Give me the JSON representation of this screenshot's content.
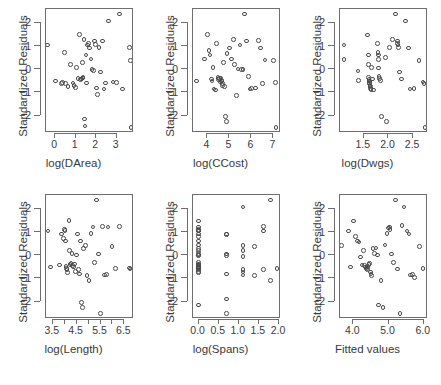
{
  "figure": {
    "title": "",
    "rows": 2,
    "cols": 3,
    "background": "#ffffff",
    "point_color": "#4a4a4a",
    "axis_color": "#6e6e6e"
  },
  "chart_data": [
    {
      "type": "scatter",
      "title": "",
      "xlabel": "log(DArea)",
      "ylabel": "Standardized Residuals",
      "xlim": [
        -0.45,
        3.85
      ],
      "ylim": [
        -2.75,
        2.6
      ],
      "xticks": [
        0,
        1,
        2,
        3
      ],
      "xticklabels": [
        "0",
        "1",
        "2",
        "3"
      ],
      "yticks": [
        2,
        1,
        0,
        -1,
        -2
      ],
      "yticklabels": [
        "2",
        "1",
        "0",
        "-1",
        "-2"
      ],
      "grid": false,
      "legend": "none",
      "marker": "open-circle",
      "x": [
        -0.38,
        0.02,
        0.3,
        0.35,
        0.44,
        0.5,
        0.62,
        0.74,
        0.86,
        0.92,
        0.98,
        1.05,
        1.12,
        1.18,
        1.24,
        1.28,
        1.32,
        1.34,
        1.36,
        1.4,
        1.42,
        1.45,
        1.5,
        1.52,
        1.58,
        1.62,
        1.68,
        1.74,
        1.8,
        1.86,
        1.92,
        1.96,
        2.02,
        2.08,
        2.14,
        2.22,
        2.3,
        2.38,
        2.46,
        2.6,
        2.82,
        3.0,
        3.14,
        3.3,
        3.62,
        3.68,
        3.7
      ],
      "y": [
        1.05,
        -0.5,
        -0.62,
        -0.58,
        0.72,
        -0.62,
        -0.74,
        0.2,
        -0.6,
        -0.7,
        -0.78,
        0.08,
        -0.4,
        1.5,
        -0.45,
        -0.42,
        0.28,
        -0.38,
        -0.35,
        1.28,
        -2.15,
        -2.45,
        0.62,
        -0.6,
        1.05,
        1.12,
        0.92,
        0.45,
        0.0,
        -0.05,
        1.22,
        1.08,
        -0.8,
        -1.1,
        0.95,
        -0.12,
        1.22,
        -0.85,
        -0.6,
        2.08,
        -0.55,
        -0.58,
        2.38,
        -0.85,
        0.95,
        0.38,
        -2.5
      ]
    },
    {
      "type": "scatter",
      "title": "",
      "xlabel": "log(CCost)",
      "ylabel": "Standardized Residuals",
      "xlim": [
        3.35,
        7.35
      ],
      "ylim": [
        -2.75,
        2.6
      ],
      "xticks": [
        4,
        5,
        6,
        7
      ],
      "xticklabels": [
        "4",
        "5",
        "6",
        "7"
      ],
      "yticks": [
        2,
        1,
        0,
        -1,
        -2
      ],
      "yticklabels": [
        "2",
        "1",
        "0",
        "-1",
        "-2"
      ],
      "grid": false,
      "legend": "none",
      "marker": "open-circle",
      "x": [
        3.5,
        3.88,
        4.02,
        4.08,
        4.12,
        4.18,
        4.22,
        4.26,
        4.3,
        4.36,
        4.42,
        4.48,
        4.52,
        4.56,
        4.6,
        4.62,
        4.64,
        4.66,
        4.68,
        4.7,
        4.74,
        4.78,
        4.82,
        4.86,
        4.9,
        5.02,
        5.1,
        5.18,
        5.24,
        5.32,
        5.4,
        5.48,
        5.56,
        5.62,
        5.7,
        5.78,
        5.86,
        5.94,
        6.02,
        6.18,
        6.32,
        6.42,
        6.5,
        6.62,
        7.02,
        7.1,
        7.12
      ],
      "y": [
        -0.5,
        0.45,
        1.5,
        0.82,
        0.62,
        -0.42,
        -0.5,
        0.08,
        -0.85,
        -0.9,
        1.12,
        -0.35,
        -0.45,
        -0.4,
        -0.55,
        -0.38,
        -0.48,
        -0.5,
        -0.62,
        -0.7,
        0.28,
        -0.75,
        -2.05,
        -2.25,
        0.68,
        0.92,
        0.45,
        1.28,
        0.2,
        -1.12,
        0.02,
        1.05,
        0.0,
        0.0,
        2.38,
        1.22,
        -0.32,
        -0.85,
        -0.82,
        -0.8,
        1.25,
        0.92,
        -0.62,
        0.4,
        0.38,
        -0.58,
        -2.5
      ]
    },
    {
      "type": "scatter",
      "title": "",
      "xlabel": "log(Dwgs)",
      "ylabel": "Standardized Residuals",
      "xlim": [
        1.02,
        2.8
      ],
      "ylim": [
        -2.75,
        2.6
      ],
      "xticks": [
        1.5,
        2.0,
        2.5
      ],
      "xticklabels": [
        "1.5",
        "2.0",
        "2.5"
      ],
      "yticks": [
        2,
        1,
        0,
        -1,
        -2
      ],
      "yticklabels": [
        "2",
        "1",
        "0",
        "-1",
        "-2"
      ],
      "grid": false,
      "legend": "none",
      "marker": "open-circle",
      "x": [
        1.1,
        1.1,
        1.38,
        1.4,
        1.58,
        1.6,
        1.6,
        1.6,
        1.61,
        1.62,
        1.62,
        1.62,
        1.63,
        1.64,
        1.64,
        1.65,
        1.66,
        1.68,
        1.7,
        1.78,
        1.79,
        1.8,
        1.8,
        1.8,
        1.81,
        1.82,
        1.84,
        1.86,
        1.94,
        1.96,
        2.02,
        2.08,
        2.14,
        2.18,
        2.18,
        2.19,
        2.2,
        2.22,
        2.26,
        2.34,
        2.4,
        2.44,
        2.52,
        2.62,
        2.7,
        2.72,
        2.74
      ],
      "y": [
        1.05,
        0.42,
        -0.08,
        -0.48,
        1.48,
        0.62,
        0.2,
        -0.35,
        -0.45,
        -0.5,
        -0.58,
        -0.62,
        -0.7,
        -0.75,
        -0.82,
        -0.88,
        0.08,
        -0.42,
        -0.9,
        1.12,
        0.72,
        0.62,
        0.42,
        0.05,
        -0.32,
        -0.4,
        -0.48,
        -2.05,
        0.52,
        -2.25,
        0.95,
        1.28,
        2.38,
        1.22,
        1.12,
        1.05,
        0.95,
        -0.12,
        -0.42,
        2.08,
        0.92,
        -0.85,
        -0.82,
        0.38,
        -0.55,
        -0.62,
        -2.5
      ]
    },
    {
      "type": "scatter",
      "title": "",
      "xlabel": "log(Length)",
      "ylabel": "Standardized Residuals",
      "xlim": [
        3.22,
        6.9
      ],
      "ylim": [
        -2.75,
        2.6
      ],
      "xticks": [
        3.5,
        4.0,
        4.5,
        5.0,
        5.5,
        6.0,
        6.5
      ],
      "xticklabels": [
        "3.5",
        "",
        "4.5",
        "",
        "5.5",
        "",
        "6.5"
      ],
      "yticks": [
        2,
        1,
        0,
        -1,
        -2
      ],
      "yticklabels": [
        "2",
        "1",
        "0",
        "-1",
        "-2"
      ],
      "grid": false,
      "legend": "none",
      "marker": "open-circle",
      "x": [
        3.3,
        3.4,
        3.78,
        3.88,
        3.96,
        4.0,
        4.02,
        4.04,
        4.06,
        4.08,
        4.1,
        4.12,
        4.18,
        4.2,
        4.22,
        4.26,
        4.3,
        4.34,
        4.38,
        4.42,
        4.46,
        4.5,
        4.54,
        4.58,
        4.62,
        4.66,
        4.7,
        4.74,
        4.8,
        4.86,
        4.94,
        5.02,
        5.1,
        5.18,
        5.26,
        5.34,
        5.42,
        5.5,
        5.58,
        5.66,
        5.74,
        5.82,
        5.98,
        6.12,
        6.3,
        6.72,
        6.74
      ],
      "y": [
        1.05,
        -0.5,
        -0.42,
        0.92,
        0.72,
        1.12,
        1.08,
        0.62,
        -0.48,
        -0.58,
        -0.62,
        -0.75,
        1.5,
        0.2,
        -0.4,
        -0.35,
        0.08,
        -0.45,
        -0.5,
        -0.38,
        -0.7,
        0.02,
        0.92,
        -0.62,
        -0.8,
        0.62,
        -2.05,
        -2.25,
        0.28,
        0.42,
        -0.88,
        -1.1,
        0.95,
        1.22,
        -0.32,
        2.38,
        0.05,
        -2.5,
        1.25,
        -0.85,
        -0.82,
        1.22,
        0.38,
        -0.58,
        1.25,
        -0.55,
        -0.6
      ]
    },
    {
      "type": "scatter",
      "title": "",
      "xlabel": "log(Spans)",
      "ylabel": "Standardized Residuals",
      "xlim": [
        -0.14,
        2.05
      ],
      "ylim": [
        -2.75,
        2.6
      ],
      "xticks": [
        0.0,
        0.5,
        1.0,
        1.5,
        2.0
      ],
      "xticklabels": [
        "0.0",
        "0.5",
        "1.0",
        "1.5",
        "2.0"
      ],
      "yticks": [
        2,
        1,
        0,
        -1,
        -2
      ],
      "yticklabels": [
        "2",
        "1",
        "0",
        "-1",
        "-2"
      ],
      "grid": false,
      "legend": "none",
      "marker": "open-circle",
      "x": [
        0.0,
        0.0,
        0.0,
        0.0,
        0.0,
        0.0,
        0.0,
        0.0,
        0.0,
        0.0,
        0.0,
        0.0,
        0.0,
        0.0,
        0.0,
        0.0,
        0.0,
        0.0,
        0.0,
        0.0,
        0.0,
        0.0,
        0.0,
        0.0,
        0.0,
        0.69,
        0.69,
        0.69,
        0.69,
        0.69,
        0.69,
        0.69,
        1.1,
        1.1,
        1.1,
        1.1,
        1.1,
        1.1,
        1.1,
        1.39,
        1.39,
        1.61,
        1.61,
        1.61,
        1.79,
        1.79,
        1.95
      ],
      "y": [
        1.48,
        1.22,
        1.1,
        1.08,
        1.05,
        0.92,
        0.82,
        0.62,
        0.45,
        0.28,
        0.2,
        0.08,
        0.02,
        0.0,
        -0.32,
        -0.38,
        -0.42,
        -0.48,
        -0.5,
        -0.55,
        -0.58,
        -0.62,
        -0.7,
        -0.75,
        -2.15,
        0.92,
        0.9,
        0.05,
        0.0,
        -0.8,
        -1.88,
        -2.5,
        2.08,
        0.42,
        0.2,
        -0.05,
        -0.62,
        -0.72,
        -0.85,
        0.38,
        -0.88,
        1.25,
        1.05,
        -0.62,
        2.38,
        -1.1,
        -0.58
      ]
    },
    {
      "type": "scatter",
      "title": "",
      "xlabel": "Fitted values",
      "ylabel": "Standardized Residuals",
      "xlim": [
        3.62,
        6.12
      ],
      "ylim": [
        -2.75,
        2.6
      ],
      "xticks": [
        4.0,
        5.0,
        6.0
      ],
      "xticklabels": [
        "4.0",
        "5.0",
        "6.0"
      ],
      "yticks": [
        2,
        1,
        0,
        -1,
        -2
      ],
      "yticklabels": [
        "2",
        "1",
        "0",
        "-1",
        "-2"
      ],
      "grid": false,
      "legend": "none",
      "marker": "open-circle",
      "x": [
        3.66,
        3.86,
        3.92,
        4.0,
        4.06,
        4.12,
        4.16,
        4.2,
        4.24,
        4.28,
        4.32,
        4.34,
        4.36,
        4.38,
        4.4,
        4.42,
        4.44,
        4.46,
        4.48,
        4.5,
        4.52,
        4.56,
        4.6,
        4.64,
        4.68,
        4.72,
        4.78,
        4.84,
        4.9,
        4.96,
        5.0,
        5.02,
        5.04,
        5.08,
        5.14,
        5.2,
        5.26,
        5.32,
        5.38,
        5.44,
        5.52,
        5.58,
        5.62,
        5.68,
        5.74,
        5.88,
        5.98
      ],
      "y": [
        0.42,
        1.05,
        -0.5,
        1.48,
        0.82,
        0.62,
        0.58,
        -0.08,
        -0.42,
        0.2,
        -0.45,
        -0.5,
        -0.55,
        -0.58,
        -0.62,
        -0.48,
        -0.4,
        -0.35,
        -0.72,
        -0.8,
        -0.88,
        0.28,
        0.08,
        0.32,
        0.02,
        -2.15,
        -1.1,
        -2.25,
        0.45,
        0.95,
        1.18,
        1.22,
        1.12,
        0.05,
        -0.32,
        2.38,
        -0.6,
        -2.5,
        1.28,
        2.08,
        1.05,
        0.92,
        -0.85,
        -0.82,
        -0.95,
        0.38,
        -0.58
      ]
    }
  ],
  "panels": [
    {
      "xlabel": "log(DArea)",
      "ylabel": "Standardized Residuals"
    },
    {
      "xlabel": "log(CCost)",
      "ylabel": "Standardized Residuals"
    },
    {
      "xlabel": "log(Dwgs)",
      "ylabel": "Standardized Residuals"
    },
    {
      "xlabel": "log(Length)",
      "ylabel": "Standardized Residuals"
    },
    {
      "xlabel": "log(Spans)",
      "ylabel": "Standardized Residuals"
    },
    {
      "xlabel": "Fitted values",
      "ylabel": "Standardized Residuals"
    }
  ]
}
